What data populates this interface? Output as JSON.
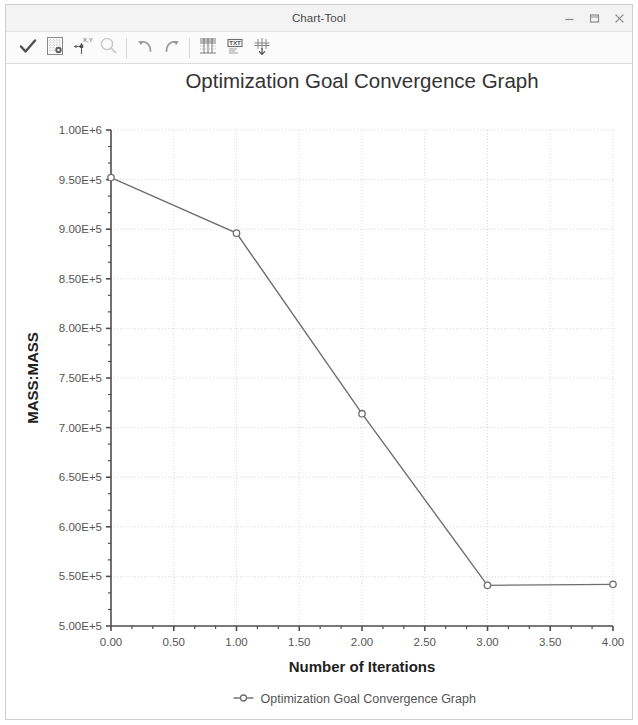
{
  "window": {
    "title": "Chart-Tool",
    "controls": [
      {
        "name": "minimize-button",
        "glyph": "–"
      },
      {
        "name": "maximize-button",
        "glyph": "▭"
      },
      {
        "name": "close-button",
        "glyph": "✕"
      }
    ]
  },
  "toolbar": {
    "items": [
      {
        "name": "apply-check-button",
        "icon": "checkmark-icon",
        "tooltip": "Apply",
        "enabled": true
      },
      {
        "name": "chart-settings-button",
        "icon": "grid-settings-icon",
        "tooltip": "Chart Settings",
        "enabled": true
      },
      {
        "name": "axis-settings-button",
        "icon": "axis-xy-icon",
        "tooltip": "Axis Settings",
        "enabled": true
      },
      {
        "name": "zoom-button",
        "icon": "magnifier-icon",
        "tooltip": "Zoom",
        "enabled": false
      },
      {
        "name": "undo-button",
        "icon": "undo-arrow-icon",
        "tooltip": "Undo",
        "enabled": true
      },
      {
        "name": "redo-button",
        "icon": "redo-arrow-icon",
        "tooltip": "Redo",
        "enabled": true
      },
      {
        "name": "table-view-button",
        "icon": "table-icon",
        "tooltip": "Table View",
        "enabled": true
      },
      {
        "name": "text-annotate-button",
        "icon": "text-box-icon",
        "tooltip": "Text",
        "enabled": true
      },
      {
        "name": "plot-export-button",
        "icon": "plot-export-icon",
        "tooltip": "Export Plot",
        "enabled": true
      }
    ]
  },
  "chart_data": {
    "type": "line",
    "title": "Optimization Goal Convergence Graph",
    "xlabel": "Number of Iterations",
    "ylabel": "MASS:MASS",
    "x": [
      0,
      1,
      2,
      3,
      4
    ],
    "values": [
      952000,
      896000,
      714000,
      541000,
      542000
    ],
    "series": [
      {
        "name": "Optimization Goal Convergence Graph",
        "values": [
          952000,
          896000,
          714000,
          541000,
          542000
        ],
        "color": "#6e6e6e",
        "marker": "circle"
      }
    ],
    "xlim": [
      0,
      4
    ],
    "ylim": [
      500000,
      1000000
    ],
    "xticks": [
      0,
      0.5,
      1,
      1.5,
      2,
      2.5,
      3,
      3.5,
      4
    ],
    "xtick_labels": [
      "0.00",
      "0.50",
      "1.00",
      "1.50",
      "2.00",
      "2.50",
      "3.00",
      "3.50",
      "4.00"
    ],
    "yticks": [
      500000,
      550000,
      600000,
      650000,
      700000,
      750000,
      800000,
      850000,
      900000,
      950000,
      1000000
    ],
    "ytick_labels": [
      "5.00E+5",
      "5.50E+5",
      "6.00E+5",
      "6.50E+5",
      "7.00E+5",
      "7.50E+5",
      "8.00E+5",
      "8.50E+5",
      "9.00E+5",
      "9.50E+5",
      "1.00E+6"
    ],
    "grid": true,
    "grid_style": "dotted",
    "grid_color": "#d9d9d9",
    "legend": {
      "position": "bottom",
      "entries": [
        "Optimization Goal Convergence Graph"
      ]
    },
    "minor_ticks_per_interval": 2,
    "axis_color": "#4d4d4d"
  }
}
